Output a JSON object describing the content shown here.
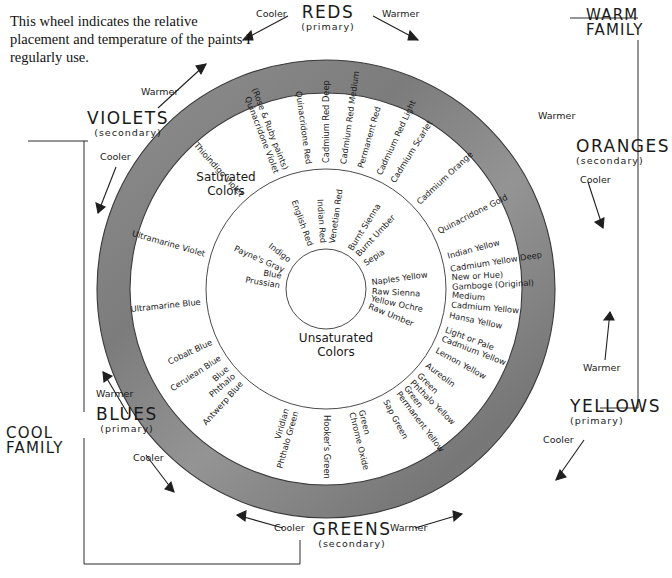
{
  "caption": "This wheel indicates the relative placement and temperature of the paints I regularly use.",
  "colors": {
    "ring_gray_light": "#a8a8a8",
    "ring_gray_dark": "#6f6f6f",
    "ink": "#1b1b1b",
    "paper": "#ffffff"
  },
  "families": [
    {
      "name": "REDS",
      "sub": "(primary)",
      "angle_deg": 270
    },
    {
      "name": "ORANGES",
      "sub": "(secondary)",
      "angle_deg": 315
    },
    {
      "name": "YELLOWS",
      "sub": "(primary)",
      "angle_deg": 0
    },
    {
      "name": "GREENS",
      "sub": "(secondary)",
      "angle_deg": 90
    },
    {
      "name": "BLUES",
      "sub": "(primary)",
      "angle_deg": 160
    },
    {
      "name": "VIOLETS",
      "sub": "(secondary)",
      "angle_deg": 205
    }
  ],
  "corners": {
    "warm": "WARM\nFAMILY",
    "warm_line1": "WARM",
    "warm_line2": "FAMILY",
    "cool_line1": "COOL",
    "cool_line2": "FAMILY"
  },
  "temperature_labels": {
    "cooler": "Cooler",
    "warmer": "Warmer"
  },
  "ring_titles": {
    "saturated_line1": "Saturated",
    "saturated_line2": "Colors",
    "unsaturated_line1": "Unsaturated",
    "unsaturated_line2": "Colors"
  },
  "chart_data": {
    "type": "pie",
    "xlabel": "",
    "ylabel": "",
    "legend": [
      "WARM FAMILY",
      "COOL FAMILY"
    ],
    "annotations": [
      "Cooler",
      "Warmer",
      "Saturated Colors",
      "Unsaturated Colors"
    ],
    "rings": [
      {
        "name": "outer-gradient-band",
        "kind": "gray gradient annulus"
      },
      {
        "name": "saturated-colors",
        "kind": "named paint labels, radial"
      },
      {
        "name": "unsaturated-colors",
        "kind": "named paint labels, radial"
      },
      {
        "name": "hub",
        "kind": "empty circle"
      }
    ],
    "categories": [
      "REDS",
      "ORANGES",
      "YELLOWS",
      "GREENS",
      "BLUES",
      "VIOLETS"
    ],
    "values": [
      6,
      2,
      8,
      7,
      5,
      3
    ],
    "saturated_paints": [
      {
        "label": "Quinacridone Violet\n(Rose & Ruby paints)",
        "angle_deg": 249,
        "family": "VIOLETS"
      },
      {
        "label": "Quinacridone Red",
        "angle_deg": 262,
        "family": "REDS"
      },
      {
        "label": "Cadmium Red Deep",
        "angle_deg": 270,
        "family": "REDS"
      },
      {
        "label": "Cadmium Red Medium",
        "angle_deg": 278,
        "family": "REDS"
      },
      {
        "label": "Permanent Red",
        "angle_deg": 286,
        "family": "REDS"
      },
      {
        "label": "Cadmium Red Light",
        "angle_deg": 295,
        "family": "REDS"
      },
      {
        "label": "Cadmium Scarlet",
        "angle_deg": 302,
        "family": "REDS"
      },
      {
        "label": "Cadmium Orange",
        "angle_deg": 317,
        "family": "ORANGES"
      },
      {
        "label": "Quinacridone Gold",
        "angle_deg": 333,
        "family": "ORANGES"
      },
      {
        "label": "Indian Yellow",
        "angle_deg": 345,
        "family": "YELLOWS"
      },
      {
        "label": "Cadmium Yellow Deep",
        "angle_deg": 351,
        "family": "YELLOWS"
      },
      {
        "label": "Gamboge (Original)\nNew or Hue)",
        "angle_deg": 357,
        "family": "YELLOWS"
      },
      {
        "label": "Cadmium Yellow\nMedium",
        "angle_deg": 5,
        "family": "YELLOWS"
      },
      {
        "label": "Hansa Yellow",
        "angle_deg": 12,
        "family": "YELLOWS"
      },
      {
        "label": "Cadmium Yellow\nLight or Pale",
        "angle_deg": 21,
        "family": "YELLOWS"
      },
      {
        "label": "Lemon Yellow",
        "angle_deg": 29,
        "family": "YELLOWS"
      },
      {
        "label": "Aureolin",
        "angle_deg": 37,
        "family": "YELLOWS"
      },
      {
        "label": "Phthalo Yellow\nGreen",
        "angle_deg": 45,
        "family": "GREENS"
      },
      {
        "label": "Permanent Yellow\nGreen",
        "angle_deg": 53,
        "family": "GREENS"
      },
      {
        "label": "Sap Green",
        "angle_deg": 62,
        "family": "GREENS"
      },
      {
        "label": "Chrome Oxide\nGreen",
        "angle_deg": 76,
        "family": "GREENS"
      },
      {
        "label": "Hooker's Green",
        "angle_deg": 90,
        "family": "GREENS"
      },
      {
        "label": "Phthalo Green\nViridian",
        "angle_deg": 106,
        "family": "GREENS"
      },
      {
        "label": "Antwerp Blue",
        "angle_deg": 132,
        "family": "BLUES"
      },
      {
        "label": "Phthalo\nBlue",
        "angle_deg": 139,
        "family": "BLUES"
      },
      {
        "label": "Cerulean Blue",
        "angle_deg": 147,
        "family": "BLUES"
      },
      {
        "label": "Cobalt Blue",
        "angle_deg": 155,
        "family": "BLUES"
      },
      {
        "label": "Ultramarine Blue",
        "angle_deg": 174,
        "family": "BLUES"
      },
      {
        "label": "Ultramarine Violet",
        "angle_deg": 196,
        "family": "VIOLETS"
      },
      {
        "label": "Thioindigo Violet",
        "angle_deg": 228,
        "family": "VIOLETS"
      }
    ],
    "unsaturated_paints": [
      {
        "label": "English Red",
        "angle_deg": 250
      },
      {
        "label": "Indian Red",
        "angle_deg": 266
      },
      {
        "label": "Venetian Red",
        "angle_deg": 278
      },
      {
        "label": "Burnt Sienna",
        "angle_deg": 302
      },
      {
        "label": "Burnt Umber",
        "angle_deg": 313
      },
      {
        "label": "Sepia",
        "angle_deg": 327
      },
      {
        "label": "Naples Yellow",
        "angle_deg": 352
      },
      {
        "label": "Raw Sienna",
        "angle_deg": 3
      },
      {
        "label": "Yellow Ochre",
        "angle_deg": 12
      },
      {
        "label": "Raw Umber",
        "angle_deg": 22
      },
      {
        "label": "Payne's Gray",
        "angle_deg": 204
      },
      {
        "label": "Indigo",
        "angle_deg": 218
      },
      {
        "label": "Prussian\nBlue",
        "angle_deg": 190
      }
    ]
  }
}
